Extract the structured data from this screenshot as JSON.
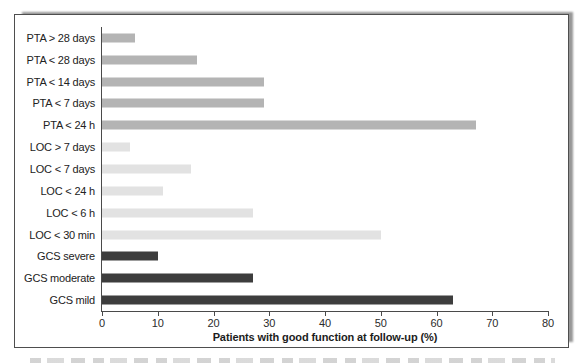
{
  "chart_data": {
    "type": "bar",
    "orientation": "horizontal",
    "title": "",
    "xlabel": "Patients with good function at follow-up (%)",
    "ylabel": "",
    "xlim": [
      0,
      80
    ],
    "xticks": [
      0,
      10,
      20,
      30,
      40,
      50,
      60,
      70,
      80
    ],
    "grid": false,
    "legend": false,
    "categories": [
      "PTA > 28 days",
      "PTA < 28 days",
      "PTA < 14 days",
      "PTA < 7 days",
      "PTA < 24 h",
      "LOC > 7 days",
      "LOC < 7 days",
      "LOC < 24 h",
      "LOC < 6 h",
      "LOC < 30 min",
      "GCS severe",
      "GCS moderate",
      "GCS mild"
    ],
    "values": [
      6,
      17,
      29,
      29,
      67,
      5,
      16,
      11,
      27,
      50,
      10,
      27,
      63
    ],
    "groups": [
      "pta",
      "pta",
      "pta",
      "pta",
      "pta",
      "loc",
      "loc",
      "loc",
      "loc",
      "loc",
      "gcs",
      "gcs",
      "gcs"
    ],
    "group_colors": {
      "pta": "#b4b4b4",
      "loc": "#e2e2e2",
      "gcs": "#3d3d3d"
    }
  }
}
